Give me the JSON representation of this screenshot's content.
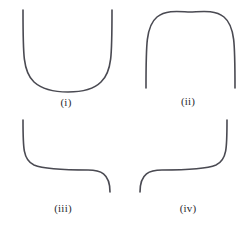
{
  "figure": {
    "width": 247,
    "height": 227,
    "background_color": "#ffffff",
    "stroke_color": "#4a4a52",
    "stroke_width": 1.6,
    "label_color": "#2b2b30"
  },
  "panels": [
    {
      "id": "panel-i",
      "label": "(i)",
      "label_x": 66,
      "label_y": 102,
      "shape": "u-curve",
      "shape_description": "U shape: two vertical strokes descending from the top, joined by a wide flat rounded bottom",
      "path": "M 23 10 C 23 55 23 72 34 82 C 44 91 60 92 68 92 C 77 92 92 91 101 82 C 112 72 112 55 112 10"
    },
    {
      "id": "panel-ii",
      "label": "(ii)",
      "label_x": 188,
      "label_y": 101,
      "shape": "arch-curve",
      "shape_description": "Inverted U arch: wide flat rounded top with two sides descending into vertical strokes",
      "path": "M 146 88 C 146 44 146 26 157 17 C 167 9 182 12 190 12 C 199 12 214 9 224 17 C 235 26 235 44 235 88"
    },
    {
      "id": "panel-iii",
      "label": "(iii)",
      "label_x": 63,
      "label_y": 208,
      "shape": "s-curve-descending",
      "shape_description": "S shape: vertical stroke from upper left curving right into a long horizontal run, then curving down into a vertical stroke at the right",
      "path": "M 23 120 C 23 148 23 160 34 165 C 46 170 72 170 88 170 C 100 170 110 173 110 192"
    },
    {
      "id": "panel-iv",
      "label": "(iv)",
      "label_x": 188,
      "label_y": 208,
      "shape": "s-curve-ascending",
      "shape_description": "Mirrored S shape: vertical stroke from lower left curving right into a long horizontal run, then curving up into a vertical stroke at the right",
      "path": "M 140 192 C 140 173 150 170 162 170 C 178 170 204 170 216 165 C 227 160 227 148 227 120"
    }
  ]
}
